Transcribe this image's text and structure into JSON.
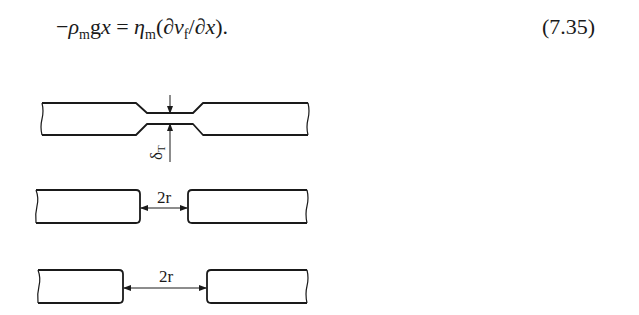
{
  "equation": {
    "minus": "−",
    "rho": "ρ",
    "rho_sub": "m",
    "g": "g",
    "x": "x",
    "equals": " = ",
    "eta": "η",
    "eta_sub": "m",
    "open": "(∂",
    "v": "v",
    "v_sub": "f",
    "slash": "/∂",
    "x2": "x",
    "close": ")."
  },
  "equation_number": "(7.35)",
  "figure": {
    "panel_1": {
      "label": "δ",
      "label_sub": "T"
    },
    "panel_2": {
      "label": "2r"
    },
    "panel_3": {
      "label": "2r"
    }
  }
}
